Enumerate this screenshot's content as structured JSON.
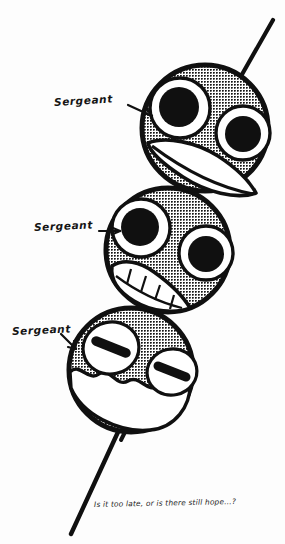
{
  "illustration": {
    "title_caption": "Is it too late, or is there still hope...?",
    "background_color": "#fdfdfd",
    "ink_color": "#101010",
    "halftone_fill": "#7d7d7d",
    "medium": "hand-drawn ink comic panel with halftone screentone",
    "subject": "three spherical heads stacked on a single skewer (dango-style)"
  },
  "labels": [
    {
      "id": "label-1",
      "text": "Sergeant",
      "arrow": "arrow-right",
      "points_to": "head-top"
    },
    {
      "id": "label-2",
      "text": "Sergeant",
      "arrow": "arrow-right",
      "points_to": "head-middle"
    },
    {
      "id": "label-3",
      "text": "Sergeant",
      "arrow": "arrow-down-right",
      "points_to": "head-bottom"
    }
  ],
  "heads": [
    {
      "id": "head-top",
      "order": 1,
      "expression": "wide-eyed grin",
      "eyes": "two large round pupils with white rings",
      "mouth": "large crescent leaf-shaped smile",
      "shading": "halftone dots"
    },
    {
      "id": "head-middle",
      "order": 2,
      "expression": "toothy grimace",
      "eyes": "two large round pupils with white rings",
      "mouth": "wide grin showing square teeth",
      "shading": "halftone dots"
    },
    {
      "id": "head-bottom",
      "order": 3,
      "expression": "closed eyes, melting",
      "eyes": "two slanted black slits",
      "mouth": "wavy drooping line",
      "shading": "halftone dots"
    }
  ],
  "skewer": {
    "name": "skewer-stick",
    "description": "single stick piercing all three heads, protruding top-right and bottom-left"
  }
}
